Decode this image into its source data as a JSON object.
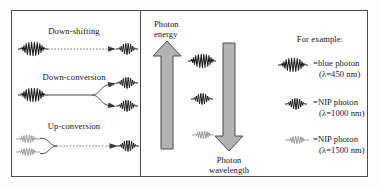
{
  "figure": {
    "colors": {
      "arrow_fill": "#b3b3b3",
      "arrow_stroke": "#4d4d4d",
      "photon_dark": "#1c1c1c",
      "photon_faint": "#8c8c8c",
      "frame": "#4a4a4a"
    }
  },
  "left_panel": {
    "processes": [
      {
        "name": "down-shifting",
        "label": "Down-shifting",
        "inputs": 1,
        "outputs": 1,
        "input_photon": "blue",
        "output_photon": "nip-1000",
        "connector": "dashed"
      },
      {
        "name": "down-conversion",
        "label": "Down-conversion",
        "inputs": 1,
        "outputs": 2,
        "input_photon": "blue",
        "output_photon": "nip-1000",
        "connector": "solid-split"
      },
      {
        "name": "up-conversion",
        "label": "Up-conversion",
        "inputs": 2,
        "outputs": 1,
        "input_photon": "nip-1500",
        "output_photon": "nip-1000",
        "connector": "solid-merge"
      }
    ]
  },
  "axis_panel": {
    "up_arrow": {
      "name": "photon-energy-arrow",
      "direction": "up",
      "label_line1": "Photon",
      "label_line2": "energy"
    },
    "down_arrow": {
      "name": "photon-wavelength-arrow",
      "direction": "down",
      "label_line1": "Photon",
      "label_line2": "wavelength"
    },
    "scale_photons": [
      {
        "name": "scale-photon-blue",
        "type": "blue"
      },
      {
        "name": "scale-photon-nip-1000",
        "type": "nip-1000"
      },
      {
        "name": "scale-photon-nip-1500",
        "type": "nip-1500"
      }
    ]
  },
  "legend": {
    "heading": "For example:",
    "entries": [
      {
        "name": "legend-blue-photon",
        "glyph": "blue",
        "line1": "=blue photon",
        "line2": "(λ=450 nm)",
        "wavelength_nm": 450
      },
      {
        "name": "legend-nip-1000-photon",
        "glyph": "nip-1000",
        "line1": "=NIP photon",
        "line2": "(λ=1000 nm)",
        "wavelength_nm": 1000
      },
      {
        "name": "legend-nip-1500-photon",
        "glyph": "nip-1500",
        "line1": "=NIP photon",
        "line2": "(λ=1500 nm)",
        "wavelength_nm": 1500
      }
    ]
  }
}
